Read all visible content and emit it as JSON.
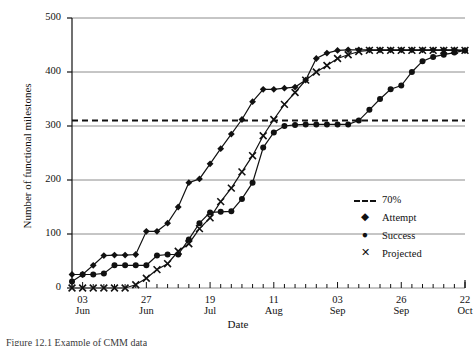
{
  "figure": {
    "caption": "Figure 12.1   Example of CMM data",
    "background": "#ffffff",
    "ink_color": "#111111",
    "grid_color": "#8c8c8c"
  },
  "chart_data": {
    "type": "line",
    "title": "",
    "xlabel": "Date",
    "ylabel": "Number of functional milestones",
    "ylim": [
      0,
      500
    ],
    "yticks": [
      0,
      100,
      200,
      300,
      400,
      500
    ],
    "grid": true,
    "legend_position": "right-inside",
    "x_tick_labels": [
      {
        "day": "03",
        "month": "Jun"
      },
      {
        "day": "27",
        "month": "Jun"
      },
      {
        "day": "19",
        "month": "Jul"
      },
      {
        "day": "11",
        "month": "Aug"
      },
      {
        "day": "03",
        "month": "Sep"
      },
      {
        "day": "26",
        "month": "Sep"
      },
      {
        "day": "22",
        "month": "Oct"
      }
    ],
    "x_minor_ticks_between_labels": 6,
    "threshold": {
      "label": "70%",
      "value": 310,
      "style": "dashed"
    },
    "series": [
      {
        "name": "Attempt",
        "marker": "diamond",
        "x": [
          0,
          1,
          2,
          3,
          4,
          5,
          6,
          7,
          8,
          9,
          10,
          11,
          12,
          13,
          14,
          15,
          16,
          17,
          18,
          19,
          20,
          21,
          22,
          23,
          24,
          25,
          26,
          27,
          28,
          29,
          30,
          31,
          32,
          33,
          34,
          35,
          36,
          37
        ],
        "values": [
          25,
          25,
          42,
          60,
          61,
          61,
          62,
          105,
          105,
          120,
          150,
          195,
          202,
          230,
          258,
          285,
          312,
          345,
          368,
          368,
          370,
          372,
          385,
          425,
          435,
          440,
          441,
          441,
          441,
          441,
          441,
          441,
          441,
          441,
          441,
          441,
          441,
          440
        ]
      },
      {
        "name": "Success",
        "marker": "circle",
        "x": [
          0,
          1,
          2,
          3,
          4,
          5,
          6,
          7,
          8,
          9,
          10,
          11,
          12,
          13,
          14,
          15,
          16,
          17,
          18,
          19,
          20,
          21,
          22,
          23,
          24,
          25,
          26,
          27,
          28,
          29,
          30,
          31,
          32,
          33,
          34,
          35,
          36,
          37
        ],
        "values": [
          12,
          25,
          25,
          27,
          42,
          42,
          42,
          42,
          60,
          62,
          62,
          90,
          120,
          140,
          141,
          142,
          165,
          195,
          260,
          288,
          300,
          302,
          303,
          303,
          303,
          303,
          303,
          310,
          330,
          350,
          368,
          375,
          400,
          420,
          428,
          432,
          436,
          440
        ]
      },
      {
        "name": "Projected",
        "marker": "cross",
        "x": [
          0,
          1,
          2,
          3,
          4,
          5,
          6,
          7,
          8,
          9,
          10,
          11,
          12,
          13,
          14,
          15,
          16,
          17,
          18,
          19,
          20,
          21,
          22,
          23,
          24,
          25,
          26,
          27,
          28,
          29,
          30,
          31,
          32,
          33,
          34,
          35,
          36,
          37
        ],
        "values": [
          0,
          0,
          0,
          0,
          0,
          0,
          6,
          18,
          34,
          45,
          68,
          82,
          110,
          130,
          160,
          185,
          215,
          245,
          282,
          312,
          340,
          362,
          385,
          400,
          412,
          425,
          432,
          438,
          440,
          440,
          440,
          440,
          440,
          440,
          440,
          440,
          440,
          440
        ]
      }
    ],
    "legend_entries": [
      {
        "label": "70%",
        "marker": "dashed-line"
      },
      {
        "label": "Attempt",
        "marker": "diamond"
      },
      {
        "label": "Success",
        "marker": "circle"
      },
      {
        "label": "Projected",
        "marker": "cross"
      }
    ]
  }
}
